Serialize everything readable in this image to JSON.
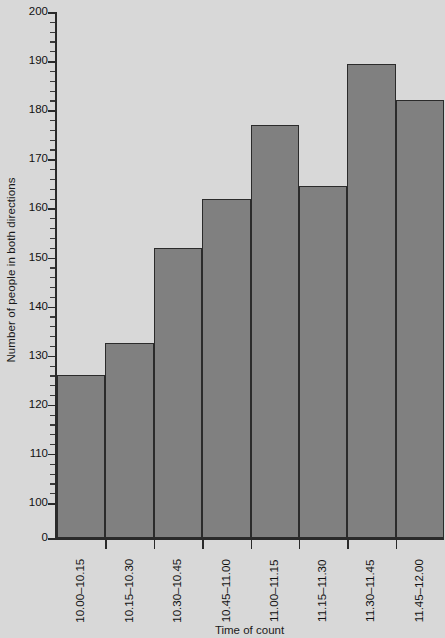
{
  "chart_data": {
    "type": "bar",
    "title": "",
    "xlabel": "Time of count",
    "ylabel": "Number of people in both directions",
    "categories": [
      "10.00–10.15",
      "10.15–10.30",
      "10.30–10.45",
      "10.45–11.00",
      "11.00–11.15",
      "11.15–11.30",
      "11.30–11.45",
      "11.45–12.00"
    ],
    "values": [
      126,
      132.5,
      152,
      162,
      177,
      164.5,
      189.5,
      182
    ],
    "ylim": [
      100,
      200
    ],
    "y_axis_broken": true,
    "y_baseline_label": "0",
    "y_major_ticks": [
      100,
      110,
      120,
      130,
      140,
      150,
      160,
      170,
      180,
      190,
      200
    ],
    "y_tick_labels": [
      "0",
      "100",
      "110",
      "120",
      "130",
      "140",
      "150",
      "160",
      "170",
      "180",
      "190",
      "200"
    ],
    "y_minor_tick_step": 2,
    "grid": false,
    "legend": null,
    "bar_color": "#808080",
    "bar_edge_color": "#2b2b2b",
    "background_color": "#d8d8d8",
    "axis_color": "#2a2a2a"
  }
}
